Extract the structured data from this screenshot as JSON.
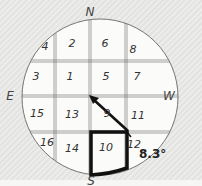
{
  "diagram": {
    "type": "sun-path grid / compass plot",
    "directions": {
      "north": "N",
      "south": "S",
      "east": "E",
      "west": "W"
    },
    "cells": [
      {
        "id": "4",
        "x": 45,
        "y": 46
      },
      {
        "id": "2",
        "x": 72,
        "y": 43
      },
      {
        "id": "6",
        "x": 105,
        "y": 43
      },
      {
        "id": "8",
        "x": 133,
        "y": 49
      },
      {
        "id": "3",
        "x": 36,
        "y": 76
      },
      {
        "id": "1",
        "x": 70,
        "y": 76
      },
      {
        "id": "5",
        "x": 106,
        "y": 76
      },
      {
        "id": "7",
        "x": 137,
        "y": 76
      },
      {
        "id": "15",
        "x": 37,
        "y": 113
      },
      {
        "id": "13",
        "x": 72,
        "y": 114
      },
      {
        "id": "9",
        "x": 107,
        "y": 113
      },
      {
        "id": "11",
        "x": 138,
        "y": 115
      },
      {
        "id": "16",
        "x": 47,
        "y": 142
      },
      {
        "id": "14",
        "x": 72,
        "y": 148
      },
      {
        "id": "10",
        "x": 106,
        "y": 147
      },
      {
        "id": "12",
        "x": 134,
        "y": 144
      }
    ],
    "highlighted_cell": "10",
    "angle_label": "8.3°",
    "colors": {
      "line": "#555555",
      "highlight": "#111111",
      "circle_fill": "#fbfbfa"
    }
  }
}
